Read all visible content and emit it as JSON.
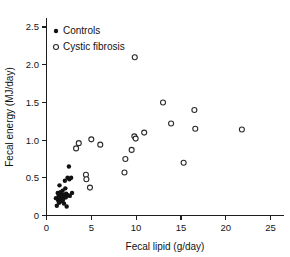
{
  "chart_data": {
    "type": "scatter",
    "title": "",
    "xlabel": "Fecal lipid (g/day)",
    "ylabel": "Fecal energy (MJ/day)",
    "xlim": [
      0,
      26.5
    ],
    "ylim": [
      0,
      2.62
    ],
    "xticks": [
      0,
      5,
      10,
      15,
      20,
      25
    ],
    "xtick_labels": [
      "0",
      "5",
      "10",
      "15",
      "20",
      "25"
    ],
    "yticks": [
      0,
      0.5,
      1.0,
      1.5,
      2.0,
      2.5
    ],
    "ytick_labels": [
      "0",
      "0.5",
      "1.0",
      "1.5",
      "2.0",
      "2.5"
    ],
    "grid": false,
    "legend_position": "upper left",
    "series": [
      {
        "name": "Controls",
        "marker": "filled-circle",
        "color": "#111111",
        "points": [
          [
            1.05,
            0.23
          ],
          [
            1.15,
            0.13
          ],
          [
            1.25,
            0.3
          ],
          [
            1.3,
            0.2
          ],
          [
            1.35,
            0.26
          ],
          [
            1.4,
            0.17
          ],
          [
            1.45,
            0.4
          ],
          [
            1.5,
            0.24
          ],
          [
            1.55,
            0.31
          ],
          [
            1.6,
            0.22
          ],
          [
            1.65,
            0.27
          ],
          [
            1.7,
            0.19
          ],
          [
            1.75,
            0.25
          ],
          [
            1.8,
            0.33
          ],
          [
            1.85,
            0.21
          ],
          [
            1.9,
            0.28
          ],
          [
            1.95,
            0.16
          ],
          [
            2.0,
            0.26
          ],
          [
            2.05,
            0.46
          ],
          [
            2.1,
            0.36
          ],
          [
            2.15,
            0.24
          ],
          [
            2.2,
            0.29
          ],
          [
            2.25,
            0.12
          ],
          [
            2.35,
            0.5
          ],
          [
            2.4,
            0.27
          ],
          [
            2.5,
            0.65
          ],
          [
            2.55,
            0.48
          ],
          [
            2.6,
            0.26
          ],
          [
            2.75,
            0.5
          ],
          [
            2.85,
            0.3
          ]
        ]
      },
      {
        "name": "Cystic fibrosis",
        "marker": "open-circle",
        "color": "#2a2a2a",
        "points": [
          [
            3.3,
            0.89
          ],
          [
            3.6,
            0.96
          ],
          [
            4.4,
            0.54
          ],
          [
            4.45,
            0.48
          ],
          [
            5.0,
            1.01
          ],
          [
            4.85,
            0.37
          ],
          [
            6.0,
            0.94
          ],
          [
            8.7,
            0.57
          ],
          [
            8.8,
            0.75
          ],
          [
            9.5,
            0.87
          ],
          [
            9.8,
            1.05
          ],
          [
            9.95,
            1.02
          ],
          [
            9.85,
            2.1
          ],
          [
            10.9,
            1.1
          ],
          [
            13.0,
            1.5
          ],
          [
            13.9,
            1.22
          ],
          [
            15.3,
            0.7
          ],
          [
            16.5,
            1.4
          ],
          [
            16.6,
            1.15
          ],
          [
            21.8,
            1.14
          ]
        ]
      }
    ]
  },
  "legend": {
    "items": [
      {
        "label": "Controls",
        "marker": "filled-circle"
      },
      {
        "label": "Cystic fibrosis",
        "marker": "open-circle"
      }
    ]
  }
}
